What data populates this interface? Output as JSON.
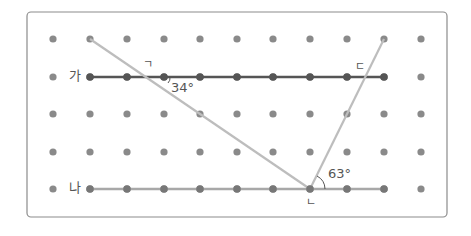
{
  "figure": {
    "grid": {
      "columns_x": [
        53,
        90,
        127,
        164,
        200,
        237,
        273,
        310,
        347,
        384,
        421
      ],
      "rows_y": [
        39,
        77,
        114,
        152,
        189
      ],
      "dot_color": "#8a8a8a",
      "dot_radius": 3.6
    },
    "frame": {
      "x": 27,
      "y": 12,
      "w": 420,
      "h": 205,
      "stroke": "#8c8c8c"
    },
    "lines": {
      "ga": {
        "label": "가",
        "x1": 90,
        "y1": 77,
        "x2": 384,
        "y2": 77,
        "color": "#555555"
      },
      "na": {
        "label": "나",
        "x1": 90,
        "y1": 189,
        "x2": 384,
        "y2": 189,
        "color": "#a8a8a8"
      },
      "transversal_left": {
        "x1": 90,
        "y1": 39,
        "x2": 310,
        "y2": 189,
        "color": "#bdbdbd"
      },
      "transversal_right": {
        "x1": 384,
        "y1": 39,
        "x2": 310,
        "y2": 189,
        "color": "#bdbdbd"
      }
    },
    "angle_labels": {
      "angle_a": "34°",
      "angle_b": "63°"
    },
    "point_labels": {
      "giyeok": "ㄱ",
      "nieun": "ㄴ",
      "digeut": "ㄷ"
    }
  }
}
